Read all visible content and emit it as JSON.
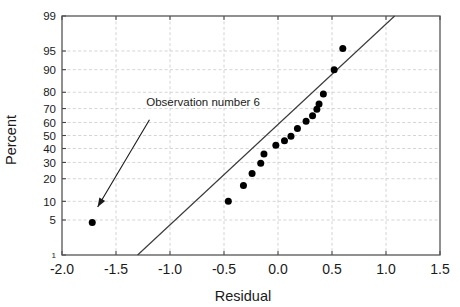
{
  "chart_data": {
    "type": "scatter",
    "title": "",
    "subtitle": "",
    "xlabel": "Residual",
    "ylabel": "Percent",
    "xlim": [
      -2.0,
      1.5
    ],
    "ylim": [
      1,
      99
    ],
    "yscale": "normal-probability",
    "grid": true,
    "legend": null,
    "xticks": [
      -2.0,
      -1.5,
      -1.0,
      -0.5,
      0.0,
      0.5,
      1.0,
      1.5
    ],
    "xticklabels": [
      "-2.0",
      "-1.5",
      "-1.0",
      "-0.5",
      "0.0",
      "0.5",
      "1.0",
      "1.5"
    ],
    "yticks": [
      1,
      5,
      10,
      20,
      30,
      40,
      50,
      60,
      70,
      80,
      90,
      95,
      99
    ],
    "yticklabels": [
      "1",
      "5",
      "10",
      "20",
      "30",
      "40",
      "50",
      "60",
      "70",
      "80",
      "90",
      "95",
      "99"
    ],
    "series": [
      {
        "name": "residuals",
        "type": "scatter",
        "marker": "filled-circle",
        "color": "#000000",
        "points": [
          {
            "x": -1.72,
            "y": 4.5,
            "label": "Observation number 6"
          },
          {
            "x": -0.46,
            "y": 10.0
          },
          {
            "x": -0.32,
            "y": 16.5
          },
          {
            "x": -0.24,
            "y": 23.0
          },
          {
            "x": -0.16,
            "y": 29.5
          },
          {
            "x": -0.13,
            "y": 36.0
          },
          {
            "x": -0.02,
            "y": 42.5
          },
          {
            "x": 0.06,
            "y": 46.0
          },
          {
            "x": 0.12,
            "y": 49.5
          },
          {
            "x": 0.18,
            "y": 55.5
          },
          {
            "x": 0.26,
            "y": 61.0
          },
          {
            "x": 0.32,
            "y": 65.0
          },
          {
            "x": 0.36,
            "y": 69.5
          },
          {
            "x": 0.38,
            "y": 73.0
          },
          {
            "x": 0.42,
            "y": 79.0
          },
          {
            "x": 0.52,
            "y": 90.0
          },
          {
            "x": 0.6,
            "y": 95.5
          }
        ]
      },
      {
        "name": "reference-line",
        "type": "line",
        "color": "#3a3a3a",
        "x0": -1.3,
        "y0": 1.0,
        "x1": 1.08,
        "y1": 99.0
      }
    ],
    "annotations": [
      {
        "text": "Observation number 6",
        "text_x": -1.22,
        "text_y": 74.0,
        "arrow_from_x": -1.19,
        "arrow_from_y": 62.0,
        "arrow_to_x": -1.67,
        "arrow_to_y": 8.2
      }
    ]
  },
  "axes": {
    "x_title": "Residual",
    "y_title": "Percent"
  },
  "colors": {
    "point": "#000000",
    "line": "#3a3a3a",
    "grid": "#c9c9d2",
    "frame": "#555555",
    "text": "#1a1a1a",
    "background": "#ffffff"
  }
}
